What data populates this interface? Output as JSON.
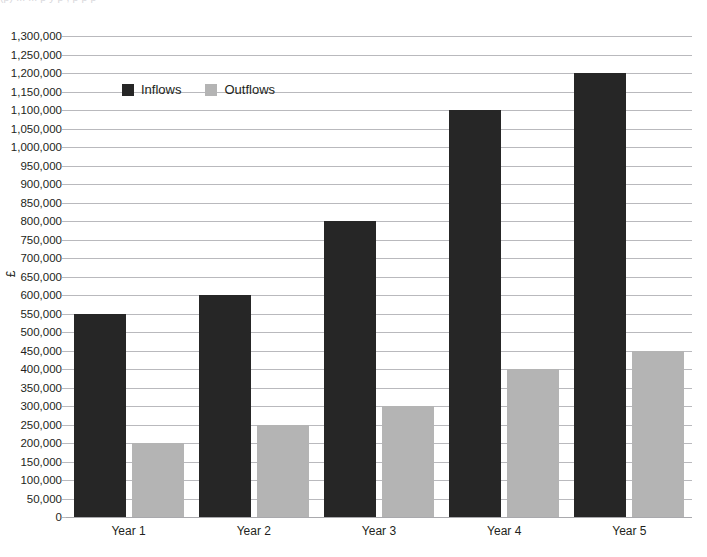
{
  "clipped_top_text": "(p) ... ... p y p , p p p",
  "chart_data": {
    "type": "bar",
    "title": "",
    "subtitle": "",
    "xlabel": "",
    "ylabel": "£",
    "categories": [
      "Year 1",
      "Year 2",
      "Year 3",
      "Year 4",
      "Year 5"
    ],
    "series": [
      {
        "name": "Inflows",
        "color": "#262626",
        "values": [
          550000,
          600000,
          800000,
          1100000,
          1200000
        ]
      },
      {
        "name": "Outflows",
        "color": "#b4b4b4",
        "values": [
          200000,
          250000,
          300000,
          400000,
          450000
        ]
      }
    ],
    "ylim": [
      0,
      1300000
    ],
    "ytick_step": 50000,
    "ytick_labels": [
      "1,300,000",
      "1,250,000",
      "1,200,000",
      "1,150,000",
      "1,100,000",
      "1,050,000",
      "1,000,000",
      "950,000",
      "900,000",
      "850,000",
      "800,000",
      "750,000",
      "700,000",
      "650,000",
      "600,000",
      "550,000",
      "500,000",
      "450,000",
      "400,000",
      "350,000",
      "300,000",
      "250,000",
      "200,000",
      "150,000",
      "100,000",
      "50,000",
      "0"
    ],
    "ytick_values": [
      1300000,
      1250000,
      1200000,
      1150000,
      1100000,
      1050000,
      1000000,
      950000,
      900000,
      850000,
      800000,
      750000,
      700000,
      650000,
      600000,
      550000,
      500000,
      450000,
      400000,
      350000,
      300000,
      250000,
      200000,
      150000,
      100000,
      50000,
      0
    ],
    "grid": true,
    "grid_color": "#b9b9bd",
    "legend_position": "top-left",
    "legend": [
      "Inflows",
      "Outflows"
    ],
    "background": "#ffffff"
  }
}
